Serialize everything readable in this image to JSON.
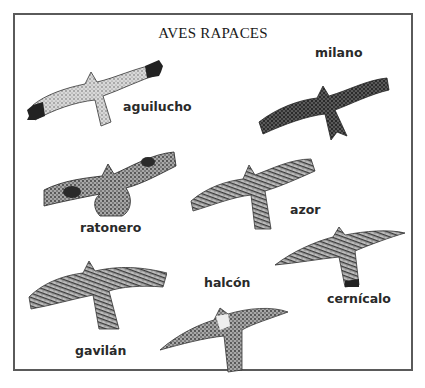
{
  "title": "AVES RAPACES",
  "birds": [
    {
      "id": "aguilucho",
      "label": "aguilucho"
    },
    {
      "id": "milano",
      "label": "milano"
    },
    {
      "id": "ratonero",
      "label": "ratonero"
    },
    {
      "id": "azor",
      "label": "azor"
    },
    {
      "id": "cernicalo",
      "label": "cernícalo"
    },
    {
      "id": "gavilan",
      "label": "gavilán"
    },
    {
      "id": "halcon",
      "label": "halcón"
    }
  ]
}
